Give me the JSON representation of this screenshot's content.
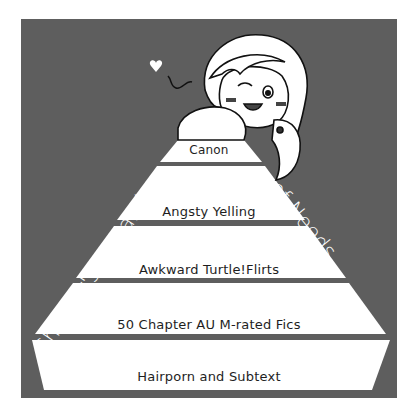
{
  "title": {
    "left": "Shipper's Hierarchy",
    "right": "of Needs"
  },
  "pyramid": {
    "tiers": [
      {
        "label": "Canon"
      },
      {
        "label": "Angsty Yelling"
      },
      {
        "label": "Awkward Turtle!Flirts"
      },
      {
        "label": "50 Chapter AU M-rated Fics"
      },
      {
        "label": "Hairporn and Subtext"
      }
    ]
  },
  "colors": {
    "background": "#5e5e5e",
    "tier_fill": "#ffffff",
    "text_dark": "#1e1e1e",
    "title_text": "#ffffff"
  },
  "illustration": {
    "description": "chibi character with ponytail resting on top of pyramid, winking",
    "icon": "heart-icon"
  }
}
